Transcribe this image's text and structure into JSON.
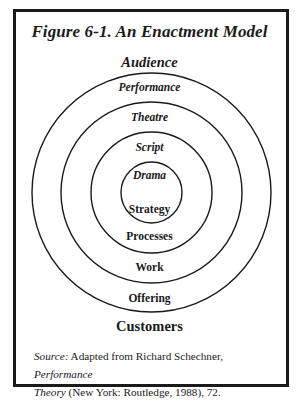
{
  "figure": {
    "title": "Figure 6-1. An Enactment Model",
    "top_label": "Audience",
    "bottom_label": "Customers"
  },
  "rings": [
    {
      "outer_label": "Performance",
      "inner_label": "Offering",
      "radius": 119.5
    },
    {
      "outer_label": "Theatre",
      "inner_label": "Work",
      "radius": 90.5
    },
    {
      "outer_label": "Script",
      "inner_label": "Processes",
      "radius": 60.5
    },
    {
      "outer_label": "Drama",
      "inner_label": "Strategy",
      "radius": 30.5
    }
  ],
  "source": {
    "prefix": "Source:",
    "text1": " Adapted from Richard Schechner, ",
    "book_part1": "Performance",
    "book_part2": "Theory",
    "text2": " (New York: Routledge, 1988), 72."
  },
  "colors": {
    "line": "#1a1a1a",
    "background": "#ffffff"
  }
}
